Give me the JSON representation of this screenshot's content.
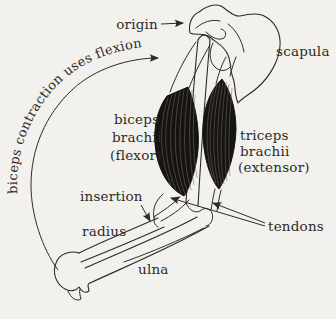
{
  "figure": {
    "type": "anatomical-diagram"
  },
  "labels": {
    "origin": "origin",
    "scapula": "scapula",
    "biceps": [
      "biceps",
      "brachii",
      "(flexor)"
    ],
    "triceps": [
      "triceps",
      "brachii",
      "(extensor)"
    ],
    "insertion": "insertion",
    "radius": "radius",
    "ulna": "ulna",
    "tendons": "tendons",
    "caption": "biceps contraction uses flexion"
  },
  "colors": {
    "background": "#f2f1ed",
    "ink": "#2e2b27",
    "muscle_fill": "#161412",
    "striation": "#716c65"
  }
}
